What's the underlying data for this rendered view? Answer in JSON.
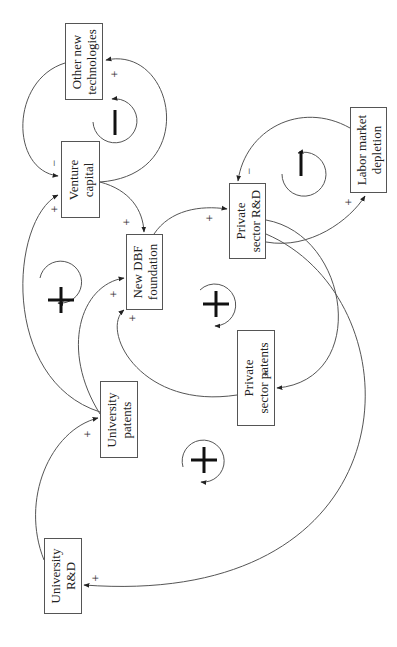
{
  "diagram": {
    "type": "causal-loop-diagram",
    "orientation": "rotated-90-ccw",
    "nodes": [
      {
        "id": "other_new_technologies",
        "label_line1": "Other new",
        "label_line2": "technologies"
      },
      {
        "id": "venture_capital",
        "label_line1": "Venture",
        "label_line2": "capital"
      },
      {
        "id": "new_dbf_foundation",
        "label_line1": "New DBF",
        "label_line2": "foundation"
      },
      {
        "id": "private_sector_rd",
        "label_line1": "Private",
        "label_line2": "sector R&D"
      },
      {
        "id": "labor_market_depletion",
        "label_line1": "Labor market",
        "label_line2": "depletion"
      },
      {
        "id": "private_sector_patents",
        "label_line1": "Private",
        "label_line2": "sector patents"
      },
      {
        "id": "university_patents",
        "label_line1": "University",
        "label_line2": "patents"
      },
      {
        "id": "university_rd",
        "label_line1": "University",
        "label_line2": "R&D"
      }
    ],
    "links": [
      {
        "from": "venture_capital",
        "to": "other_new_technologies",
        "polarity": "+"
      },
      {
        "from": "other_new_technologies",
        "to": "venture_capital",
        "polarity": "−"
      },
      {
        "from": "university_patents",
        "to": "venture_capital",
        "polarity": "+"
      },
      {
        "from": "venture_capital",
        "to": "new_dbf_foundation",
        "polarity": "+"
      },
      {
        "from": "university_patents",
        "to": "new_dbf_foundation",
        "polarity": "+"
      },
      {
        "from": "private_sector_patents",
        "to": "new_dbf_foundation",
        "polarity": "+"
      },
      {
        "from": "new_dbf_foundation",
        "to": "private_sector_rd",
        "polarity": "+"
      },
      {
        "from": "private_sector_rd",
        "to": "labor_market_depletion",
        "polarity": "+"
      },
      {
        "from": "labor_market_depletion",
        "to": "private_sector_rd",
        "polarity": "−"
      },
      {
        "from": "private_sector_rd",
        "to": "private_sector_patents",
        "polarity": "+"
      },
      {
        "from": "private_sector_rd",
        "to": "university_rd",
        "polarity": "+"
      },
      {
        "from": "university_rd",
        "to": "university_patents",
        "polarity": "+"
      }
    ],
    "loops": [
      {
        "id": "loop_vc_tech",
        "symbol": "—",
        "type": "balancing"
      },
      {
        "id": "loop_labor",
        "symbol": "—",
        "type": "balancing"
      },
      {
        "id": "loop_left",
        "symbol": "+",
        "type": "reinforcing"
      },
      {
        "id": "loop_center",
        "symbol": "+",
        "type": "reinforcing"
      },
      {
        "id": "loop_bottom",
        "symbol": "+",
        "type": "reinforcing"
      }
    ],
    "signs": {
      "plus": "+",
      "minus": "−"
    },
    "colors": {
      "line": "#555555",
      "text": "#222222",
      "background": "#ffffff"
    }
  }
}
